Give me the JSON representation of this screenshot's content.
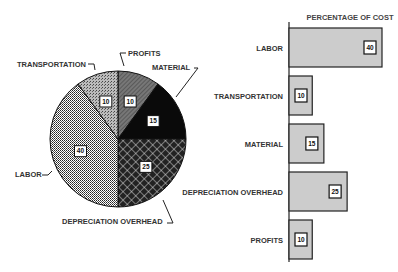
{
  "chart_data": [
    {
      "type": "pie",
      "slices": [
        {
          "label": "PROFITS",
          "value": 10,
          "pattern": "diagonal-grey"
        },
        {
          "label": "MATERIAL",
          "value": 15,
          "pattern": "black"
        },
        {
          "label": "DEPRECIATION OVERHEAD",
          "value": 25,
          "pattern": "crosshatch"
        },
        {
          "label": "LABOR",
          "value": 40,
          "pattern": "fine-grid"
        },
        {
          "label": "TRANSPORTATION",
          "value": 10,
          "pattern": "stipple"
        }
      ],
      "start": "12 o'clock",
      "direction": "clockwise"
    },
    {
      "type": "bar",
      "orientation": "horizontal",
      "title": "PERCENTAGE OF COST",
      "categories": [
        "LABOR",
        "TRANSPORTATION",
        "MATERIAL",
        "DEPRECIATION OVERHEAD",
        "PROFITS"
      ],
      "values": [
        40,
        10,
        15,
        25,
        10
      ],
      "xlim": [
        0,
        40
      ],
      "bar_color": "#cccccc"
    }
  ]
}
